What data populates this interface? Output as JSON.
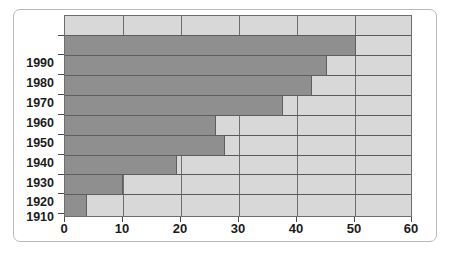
{
  "chart_data": {
    "type": "bar",
    "orientation": "horizontal",
    "title": "",
    "subtitle": "",
    "xlabel": "",
    "ylabel": "",
    "categories": [
      "1990",
      "1980",
      "1970",
      "1960",
      "1950",
      "1940",
      "1930",
      "1920",
      "1910"
    ],
    "values": [
      50.5,
      45.5,
      42.8,
      37.8,
      26.2,
      27.8,
      19.5,
      10.0,
      3.8
    ],
    "series": [
      {
        "name": "",
        "values": [
          50.5,
          45.5,
          42.8,
          37.8,
          26.2,
          27.8,
          19.5,
          10.0,
          3.8
        ]
      }
    ],
    "xlim": [
      0,
      60
    ],
    "xticks": [
      0,
      10,
      20,
      30,
      40,
      50,
      60
    ],
    "xtick_labels": [
      "0",
      "10",
      "20",
      "30",
      "40",
      "50",
      "60"
    ],
    "ytick_labels": [
      "1990",
      "1980",
      "1970",
      "1960",
      "1950",
      "1940",
      "1930",
      "1920",
      "1910"
    ],
    "grid": true,
    "grid_axis": "both",
    "legend": false,
    "legend_position": "none",
    "annotations": [],
    "colors": {
      "bar_fill": "#8f8f8f",
      "bar_edge": "#5e5e5e",
      "plot_background": "#d8d8d8",
      "figure_background": "#ffffff",
      "gridline": "#6e6e6e",
      "axis_text": "#1b1b1b",
      "frame_border": "#b9b9b9"
    }
  }
}
